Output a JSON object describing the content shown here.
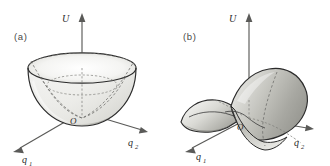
{
  "figure": {
    "background_color": "#ffffff",
    "outline_color": "#2b2b2b",
    "axis_color": "#5a5a58",
    "dashed_color": "#6b6b68",
    "surface_fill_light": "#f2f2f0",
    "surface_fill_mid": "#c9c9c4",
    "surface_fill_dark": "#8f8f8a"
  },
  "panels": [
    {
      "id": "a",
      "panel_label": "(a)",
      "surface_type": "elliptic-paraboloid",
      "surface_description": "upward opening bowl (stable minimum)",
      "axes": {
        "vertical": {
          "label": "U",
          "subscript": ""
        },
        "right": {
          "label": "q",
          "subscript": "2"
        },
        "left": {
          "label": "q",
          "subscript": "1"
        }
      },
      "origin_label": "O"
    },
    {
      "id": "b",
      "panel_label": "(b)",
      "surface_type": "hyperbolic-paraboloid",
      "surface_description": "saddle surface (unstable stationary point)",
      "axes": {
        "vertical": {
          "label": "U",
          "subscript": ""
        },
        "right": {
          "label": "q",
          "subscript": "2"
        },
        "left": {
          "label": "q",
          "subscript": "1"
        }
      },
      "origin_label": "O"
    }
  ]
}
